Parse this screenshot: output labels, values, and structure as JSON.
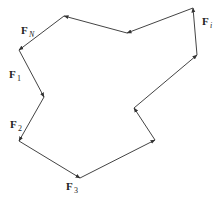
{
  "diagram": {
    "colors": {
      "stroke": "#444444",
      "label": "#222222",
      "background": "#ffffff"
    },
    "labels": {
      "fn": {
        "main": "F",
        "sub": "N"
      },
      "f1": {
        "main": "F",
        "sub": "1"
      },
      "f2": {
        "main": "F",
        "sub": "2"
      },
      "f3": {
        "main": "F",
        "sub": "3"
      },
      "fi": {
        "main": "F",
        "sub": "i"
      }
    },
    "vertices": [
      [
        64,
        16
      ],
      [
        19,
        50
      ],
      [
        44,
        97
      ],
      [
        19,
        141
      ],
      [
        80,
        178
      ],
      [
        155,
        140
      ],
      [
        134,
        108
      ],
      [
        197,
        55
      ],
      [
        193,
        8
      ],
      [
        127,
        33
      ]
    ]
  }
}
